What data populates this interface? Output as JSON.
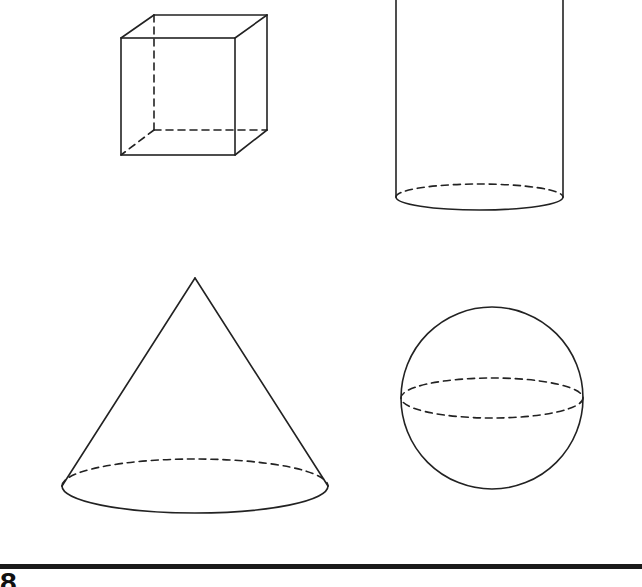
{
  "figure": {
    "shapes": [
      {
        "name": "cube",
        "position": "top-left"
      },
      {
        "name": "cylinder",
        "position": "top-right"
      },
      {
        "name": "cone",
        "position": "bottom-left"
      },
      {
        "name": "sphere",
        "position": "bottom-right"
      }
    ],
    "stroke_color": "#222222",
    "background": "#ffffff"
  },
  "footer": {
    "label": "8"
  }
}
